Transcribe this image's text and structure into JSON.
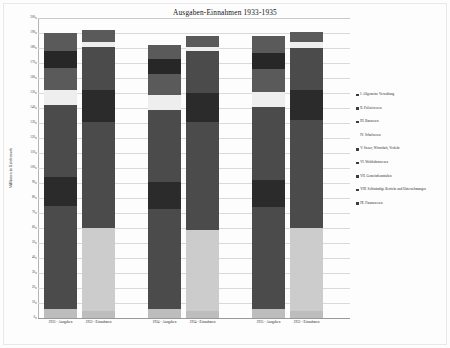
{
  "chart_data": {
    "type": "bar",
    "subtype": "stacked-bar",
    "title": "Ausgaben-Einnahmen 1933-1935",
    "xlabel": "",
    "ylabel": "Millionen in Reichsmark",
    "ylim": [
      0,
      200
    ],
    "ytick_step": 10,
    "yticks": [
      "0",
      "10",
      "20",
      "30",
      "40",
      "50",
      "60",
      "70",
      "80",
      "90",
      "100",
      "110",
      "120",
      "130",
      "140",
      "150",
      "160",
      "170",
      "180",
      "190",
      "200"
    ],
    "grid": true,
    "legend_position": "right",
    "categories": [
      "1933 - Ausgaben",
      "1933 - Einnahmen",
      "1934 - Ausgaben",
      "1934 - Einnahmen",
      "1935 - Ausgaben",
      "1935 - Einnahmen"
    ],
    "series": [
      {
        "name": "I. Allgemeine Verwaltung",
        "color": "#bdbdbd",
        "values": [
          6,
          5,
          6,
          5,
          6,
          5
        ]
      },
      {
        "name": "II. Polizeiwesen",
        "color": "#4a4a4a",
        "values": [
          12,
          0,
          11,
          0,
          12,
          0
        ]
      },
      {
        "name": "III. Bauwesen",
        "color": "#3f3f3f",
        "values": [
          20,
          0,
          19,
          0,
          20,
          0
        ]
      },
      {
        "name": "IV. Schulwesen",
        "color": "#555555",
        "values": [
          14,
          0,
          13,
          0,
          14,
          0
        ]
      },
      {
        "name": "V. Steuer, Wirtschaft, Verkehr",
        "color": "#4a4a4a",
        "values": [
          15,
          0,
          15,
          0,
          15,
          0
        ]
      },
      {
        "name": "VI. Wohlfahrtswesen",
        "color": "#2c2c2c",
        "values": [
          12,
          0,
          12,
          0,
          12,
          0
        ]
      },
      {
        "name": "VII. Gemeindeanstalten",
        "color": "#4a4a4a",
        "values": [
          51,
          0,
          48,
          0,
          49,
          0
        ]
      },
      {
        "name": "VIII. Selbständige Betriebe und Unternehmungen",
        "color": "#ececec",
        "values": [
          9,
          0,
          9,
          0,
          9,
          0
        ]
      },
      {
        "name": "IX. Finanzwesen",
        "color": "#c9c9c9",
        "values": [
          0,
          55,
          0,
          53,
          0,
          54
        ]
      }
    ],
    "bars": [
      {
        "label": "1933 - Ausgaben",
        "total": 190,
        "segments": [
          {
            "name": "I. Allgemeine Verwaltung",
            "from": 0,
            "to": 6,
            "color": "#bdbdbd"
          },
          {
            "name": "VII. Gemeindeanstalten",
            "from": 6,
            "to": 75,
            "color": "#4b4b4b"
          },
          {
            "name": "VI. Wohlfahrtswesen",
            "from": 75,
            "to": 94,
            "color": "#2b2b2b"
          },
          {
            "name": "V. Steuer, Wirtschaft, Verkehr",
            "from": 94,
            "to": 142,
            "color": "#4b4b4b"
          },
          {
            "name": "VIII. Selbständige Betriebe und Unternehmungen",
            "from": 142,
            "to": 152,
            "color": "#eeeeee"
          },
          {
            "name": "IV. Schulwesen",
            "from": 152,
            "to": 167,
            "color": "#5a5a5a"
          },
          {
            "name": "III. Bauwesen",
            "from": 167,
            "to": 178,
            "color": "#272727"
          },
          {
            "name": "II. Polizeiwesen",
            "from": 178,
            "to": 190,
            "color": "#5a5a5a"
          }
        ]
      },
      {
        "label": "1933 - Einnahmen",
        "total": 192,
        "segments": [
          {
            "name": "I. Allgemeine Verwaltung",
            "from": 0,
            "to": 5,
            "color": "#bdbdbd"
          },
          {
            "name": "IX. Finanzwesen",
            "from": 5,
            "to": 60,
            "color": "#cccccc"
          },
          {
            "name": "VII. Gemeindeanstalten",
            "from": 60,
            "to": 131,
            "color": "#4b4b4b"
          },
          {
            "name": "VI. Wohlfahrtswesen",
            "from": 131,
            "to": 152,
            "color": "#2b2b2b"
          },
          {
            "name": "V. Steuer, Wirtschaft, Verkehr",
            "from": 152,
            "to": 181,
            "color": "#4b4b4b"
          },
          {
            "name": "VIII. Selbständige Betriebe und Unternehmungen",
            "from": 181,
            "to": 184,
            "color": "#eeeeee"
          },
          {
            "name": "IV. Schulwesen",
            "from": 184,
            "to": 192,
            "color": "#5a5a5a"
          }
        ]
      },
      {
        "label": "1934 - Ausgaben",
        "total": 182,
        "segments": [
          {
            "name": "I. Allgemeine Verwaltung",
            "from": 0,
            "to": 6,
            "color": "#bdbdbd"
          },
          {
            "name": "VII. Gemeindeanstalten",
            "from": 6,
            "to": 73,
            "color": "#4b4b4b"
          },
          {
            "name": "VI. Wohlfahrtswesen",
            "from": 73,
            "to": 91,
            "color": "#2b2b2b"
          },
          {
            "name": "V. Steuer, Wirtschaft, Verkehr",
            "from": 91,
            "to": 139,
            "color": "#4b4b4b"
          },
          {
            "name": "VIII. Selbständige Betriebe und Unternehmungen",
            "from": 139,
            "to": 149,
            "color": "#eeeeee"
          },
          {
            "name": "IV. Schulwesen",
            "from": 149,
            "to": 163,
            "color": "#5a5a5a"
          },
          {
            "name": "III. Bauwesen",
            "from": 163,
            "to": 173,
            "color": "#272727"
          },
          {
            "name": "II. Polizeiwesen",
            "from": 173,
            "to": 182,
            "color": "#5a5a5a"
          }
        ]
      },
      {
        "label": "1934 - Einnahmen",
        "total": 188,
        "segments": [
          {
            "name": "I. Allgemeine Verwaltung",
            "from": 0,
            "to": 5,
            "color": "#bdbdbd"
          },
          {
            "name": "IX. Finanzwesen",
            "from": 5,
            "to": 59,
            "color": "#cccccc"
          },
          {
            "name": "VII. Gemeindeanstalten",
            "from": 59,
            "to": 131,
            "color": "#4b4b4b"
          },
          {
            "name": "VI. Wohlfahrtswesen",
            "from": 131,
            "to": 150,
            "color": "#2b2b2b"
          },
          {
            "name": "V. Steuer, Wirtschaft, Verkehr",
            "from": 150,
            "to": 178,
            "color": "#4b4b4b"
          },
          {
            "name": "VIII. Selbständige Betriebe und Unternehmungen",
            "from": 178,
            "to": 181,
            "color": "#eeeeee"
          },
          {
            "name": "IV. Schulwesen",
            "from": 181,
            "to": 188,
            "color": "#5a5a5a"
          }
        ]
      },
      {
        "label": "1935 - Ausgaben",
        "total": 188,
        "segments": [
          {
            "name": "I. Allgemeine Verwaltung",
            "from": 0,
            "to": 6,
            "color": "#bdbdbd"
          },
          {
            "name": "VII. Gemeindeanstalten",
            "from": 6,
            "to": 74,
            "color": "#4b4b4b"
          },
          {
            "name": "VI. Wohlfahrtswesen",
            "from": 74,
            "to": 92,
            "color": "#2b2b2b"
          },
          {
            "name": "V. Steuer, Wirtschaft, Verkehr",
            "from": 92,
            "to": 141,
            "color": "#4b4b4b"
          },
          {
            "name": "VIII. Selbständige Betriebe und Unternehmungen",
            "from": 141,
            "to": 151,
            "color": "#eeeeee"
          },
          {
            "name": "IV. Schulwesen",
            "from": 151,
            "to": 166,
            "color": "#5a5a5a"
          },
          {
            "name": "III. Bauwesen",
            "from": 166,
            "to": 177,
            "color": "#272727"
          },
          {
            "name": "II. Polizeiwesen",
            "from": 177,
            "to": 188,
            "color": "#5a5a5a"
          }
        ]
      },
      {
        "label": "1935 - Einnahmen",
        "total": 191,
        "segments": [
          {
            "name": "I. Allgemeine Verwaltung",
            "from": 0,
            "to": 5,
            "color": "#bdbdbd"
          },
          {
            "name": "IX. Finanzwesen",
            "from": 5,
            "to": 60,
            "color": "#cccccc"
          },
          {
            "name": "VII. Gemeindeanstalten",
            "from": 60,
            "to": 132,
            "color": "#4b4b4b"
          },
          {
            "name": "VI. Wohlfahrtswesen",
            "from": 132,
            "to": 152,
            "color": "#2b2b2b"
          },
          {
            "name": "V. Steuer, Wirtschaft, Verkehr",
            "from": 152,
            "to": 180,
            "color": "#4b4b4b"
          },
          {
            "name": "VIII. Selbständige Betriebe und Unternehmungen",
            "from": 180,
            "to": 184,
            "color": "#eeeeee"
          },
          {
            "name": "IV. Schulwesen",
            "from": 184,
            "to": 191,
            "color": "#5a5a5a"
          }
        ]
      }
    ],
    "legend": [
      {
        "label": "I. Allgemeine Verwaltung",
        "color": "#3c3c3c"
      },
      {
        "label": "II. Polizeiwesen",
        "color": "#3c3c3c"
      },
      {
        "label": "III. Bauwesen",
        "color": "#3c3c3c"
      },
      {
        "label": "IV. Schulwesen",
        "color": "#ffffff"
      },
      {
        "label": "V. Steuer, Wirtschaft, Verkehr",
        "color": "#3c3c3c"
      },
      {
        "label": "VI. Wohlfahrtswesen",
        "color": "#3c3c3c"
      },
      {
        "label": "VII. Gemeindeanstalten",
        "color": "#3c3c3c"
      },
      {
        "label": "VIII. Selbständige Betriebe und Unternehmungen",
        "color": "#3c3c3c"
      },
      {
        "label": "IX. Finanzwesen",
        "color": "#3c3c3c"
      }
    ]
  }
}
